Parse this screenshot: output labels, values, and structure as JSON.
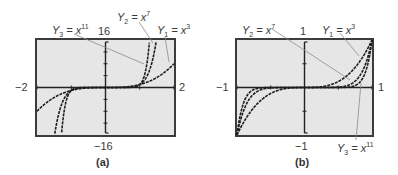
{
  "chart_data": [
    {
      "id": "a",
      "type": "line",
      "caption": "(a)",
      "xlim": [
        -2,
        2
      ],
      "ylim": [
        -16,
        16
      ],
      "x_tick_labels": {
        "min": "−2",
        "max": "2"
      },
      "y_tick_labels": {
        "min": "−16",
        "max": "16"
      },
      "yscl": 4,
      "xscl": 1,
      "grid": false,
      "background": "#e8e8e8",
      "series": [
        {
          "name": "Y1 = x^3",
          "label_main": "Y",
          "label_sub": "1",
          "label_eq": " = x",
          "label_sup": "3",
          "exponent": 3
        },
        {
          "name": "Y2 = x^7",
          "label_main": "Y",
          "label_sub": "2",
          "label_eq": " = x",
          "label_sup": "7",
          "exponent": 7
        },
        {
          "name": "Y3 = x^11",
          "label_main": "Y",
          "label_sub": "3",
          "label_eq": " = x",
          "label_sup": "11",
          "exponent": 11
        }
      ]
    },
    {
      "id": "b",
      "type": "line",
      "caption": "(b)",
      "xlim": [
        -1,
        1
      ],
      "ylim": [
        -1,
        1
      ],
      "x_tick_labels": {
        "min": "−1",
        "max": "1"
      },
      "y_tick_labels": {
        "min": "−1",
        "max": "1"
      },
      "yscl": 0.5,
      "xscl": 0.5,
      "grid": false,
      "background": "#e8e8e8",
      "series": [
        {
          "name": "Y1 = x^3",
          "label_main": "Y",
          "label_sub": "1",
          "label_eq": " = x",
          "label_sup": "3",
          "exponent": 3
        },
        {
          "name": "Y2 = x^7",
          "label_main": "Y",
          "label_sub": "2",
          "label_eq": " = x",
          "label_sup": "7",
          "exponent": 7
        },
        {
          "name": "Y3 = x^11",
          "label_main": "Y",
          "label_sub": "3",
          "label_eq": " = x",
          "label_sup": "11",
          "exponent": 11
        }
      ]
    }
  ],
  "colors": {
    "screen_bg": "#e6e6e6",
    "frame": "#3c3c3c",
    "axis": "#222222",
    "curve": "#1e1e1e",
    "leader": "#8a8a8a"
  }
}
